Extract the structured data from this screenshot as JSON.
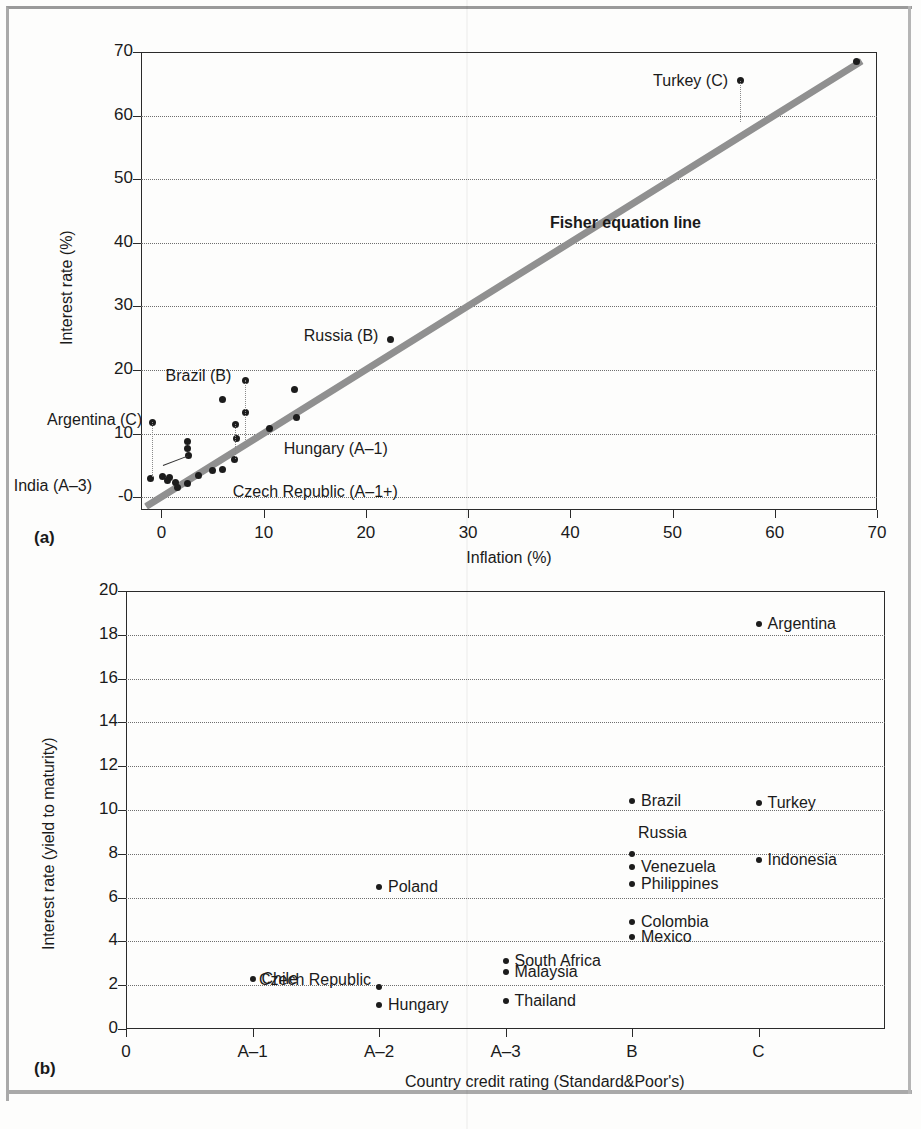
{
  "figure": {
    "width": 921,
    "height": 1129,
    "panel_a_label": "(a)",
    "panel_b_label": "(b)"
  },
  "chart_data": [
    {
      "type": "scatter",
      "panel": "(a)",
      "title": "",
      "xlabel": "Inflation (%)",
      "ylabel": "Interest rate (%)",
      "xlim": [
        -2,
        70
      ],
      "ylim": [
        -2,
        70
      ],
      "xticks": [
        0,
        10,
        20,
        30,
        40,
        50,
        60,
        70
      ],
      "xticklabels": [
        "0",
        "10",
        "20",
        "30",
        "40",
        "50",
        "60",
        "70"
      ],
      "yticks": [
        0,
        10,
        20,
        30,
        40,
        50,
        60,
        70
      ],
      "yticklabels": [
        "-0",
        "10",
        "20",
        "30",
        "40",
        "50",
        "60",
        "70"
      ],
      "grid": "horizontal-dotted",
      "annotations": [
        {
          "text": "Fisher equation line",
          "x": 38.0,
          "y": 43.0,
          "bold": true
        },
        {
          "text": "Turkey (C)",
          "x": 56.6,
          "y": 65.5,
          "anchor": "left"
        },
        {
          "text": "Russia (B)",
          "x": 22.4,
          "y": 24.8,
          "anchor": "left"
        },
        {
          "text": "Brazil (B)",
          "x": 8.2,
          "y": 18.4,
          "anchor": "left"
        },
        {
          "text": "Argentina (C)",
          "x": -0.9,
          "y": 11.8,
          "anchor": "left"
        },
        {
          "text": "India (A–3)",
          "x": 2.6,
          "y": 6.5,
          "anchor": "left"
        },
        {
          "text": "Hungary (A–1)",
          "x": 10.6,
          "y": 10.8,
          "anchor": "right"
        },
        {
          "text": "Czech Republic (A–1+)",
          "x": 6.0,
          "y": 4.3,
          "anchor": "right"
        }
      ],
      "reference_line": {
        "name": "Fisher equation line",
        "from": [
          -1.5,
          -1.5
        ],
        "to": [
          68.5,
          68.5
        ],
        "color": "#909090"
      },
      "points": [
        {
          "x": 56.6,
          "y": 65.5,
          "label": "Turkey (C)"
        },
        {
          "x": 68.0,
          "y": 68.5,
          "label": ""
        },
        {
          "x": 22.4,
          "y": 24.8,
          "label": "Russia (B)"
        },
        {
          "x": 8.2,
          "y": 18.4,
          "label": "Brazil (B)"
        },
        {
          "x": 13.0,
          "y": 16.9,
          "label": ""
        },
        {
          "x": 6.0,
          "y": 15.3,
          "label": ""
        },
        {
          "x": 13.2,
          "y": 12.6,
          "label": ""
        },
        {
          "x": 8.2,
          "y": 13.3,
          "label": ""
        },
        {
          "x": 7.2,
          "y": 11.5,
          "label": ""
        },
        {
          "x": -0.9,
          "y": 11.8,
          "label": "Argentina (C)"
        },
        {
          "x": 10.6,
          "y": 10.8,
          "label": "Hungary (A–1)"
        },
        {
          "x": 7.3,
          "y": 9.3,
          "label": ""
        },
        {
          "x": 2.5,
          "y": 8.8,
          "label": ""
        },
        {
          "x": 2.5,
          "y": 7.7,
          "label": ""
        },
        {
          "x": 2.6,
          "y": 6.5,
          "label": "India (A–3)"
        },
        {
          "x": 7.1,
          "y": 6.0,
          "label": ""
        },
        {
          "x": 6.0,
          "y": 4.3,
          "label": "Czech Republic (A–1+)"
        },
        {
          "x": 5.0,
          "y": 4.2,
          "label": ""
        },
        {
          "x": 3.6,
          "y": 3.5,
          "label": ""
        },
        {
          "x": 0.1,
          "y": 3.2,
          "label": ""
        },
        {
          "x": 0.8,
          "y": 3.1,
          "label": ""
        },
        {
          "x": -1.1,
          "y": 3.0,
          "label": ""
        },
        {
          "x": 1.4,
          "y": 2.3,
          "label": ""
        },
        {
          "x": 2.5,
          "y": 2.1,
          "label": ""
        },
        {
          "x": 1.6,
          "y": 1.6,
          "label": ""
        },
        {
          "x": 0.6,
          "y": 2.6,
          "label": ""
        }
      ]
    },
    {
      "type": "scatter",
      "panel": "(b)",
      "title": "",
      "xlabel": "Country credit rating (Standard&Poor's)",
      "ylabel": "Interest rate (yield to maturity)",
      "xlim": [
        0,
        6
      ],
      "ylim": [
        0,
        20
      ],
      "xticks": [
        0,
        1,
        2,
        3,
        4,
        5
      ],
      "xticklabels": [
        "0",
        "A–1",
        "A–2",
        "A–3",
        "B",
        "C"
      ],
      "yticks": [
        0,
        2,
        4,
        6,
        8,
        10,
        12,
        14,
        16,
        18,
        20
      ],
      "yticklabels": [
        "0",
        "2",
        "4",
        "6",
        "8",
        "10",
        "12",
        "14",
        "16",
        "18",
        "20"
      ],
      "grid": "horizontal-dotted",
      "points": [
        {
          "x": 5.0,
          "y": 18.5,
          "label": "Argentina",
          "anchor": "right"
        },
        {
          "x": 4.0,
          "y": 10.4,
          "label": "Brazil",
          "anchor": "right"
        },
        {
          "x": 5.0,
          "y": 10.3,
          "label": "Turkey",
          "anchor": "right"
        },
        {
          "x": 4.0,
          "y": 8.0,
          "label": "Russia",
          "anchor": "above-right"
        },
        {
          "x": 5.0,
          "y": 7.7,
          "label": "Indonesia",
          "anchor": "right"
        },
        {
          "x": 4.0,
          "y": 7.4,
          "label": "Venezuela",
          "anchor": "right"
        },
        {
          "x": 4.0,
          "y": 6.6,
          "label": "Philippines",
          "anchor": "right"
        },
        {
          "x": 2.0,
          "y": 6.5,
          "label": "Poland",
          "anchor": "right"
        },
        {
          "x": 4.0,
          "y": 4.9,
          "label": "Colombia",
          "anchor": "right"
        },
        {
          "x": 4.0,
          "y": 4.2,
          "label": "Mexico",
          "anchor": "right"
        },
        {
          "x": 3.0,
          "y": 3.1,
          "label": "South Africa",
          "anchor": "right"
        },
        {
          "x": 3.0,
          "y": 2.6,
          "label": "Malaysia",
          "anchor": "right"
        },
        {
          "x": 1.0,
          "y": 2.3,
          "label": "Chile",
          "anchor": "right"
        },
        {
          "x": 2.0,
          "y": 1.9,
          "label": "Czech Republic",
          "anchor": "left"
        },
        {
          "x": 3.0,
          "y": 1.3,
          "label": "Thailand",
          "anchor": "right"
        },
        {
          "x": 2.0,
          "y": 1.1,
          "label": "Hungary",
          "anchor": "right"
        }
      ]
    }
  ]
}
